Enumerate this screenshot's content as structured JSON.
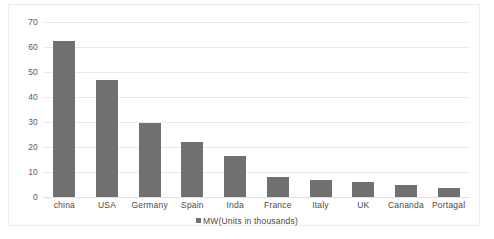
{
  "chart_data": {
    "type": "bar",
    "title": "",
    "subtitle": "",
    "xlabel": "",
    "ylabel": "",
    "ylim": [
      0,
      70
    ],
    "ytick_step": 10,
    "yticks": [
      70,
      60,
      50,
      40,
      30,
      20,
      10,
      0
    ],
    "grid": true,
    "legend_position": "bottom-center",
    "categories": [
      "china",
      "USA",
      "Germany",
      "Spain",
      "Inda",
      "France",
      "Italy",
      "UK",
      "Cananda",
      "Portagal"
    ],
    "series": [
      {
        "name": "MW(Units in thousands)",
        "color": "#707070",
        "values": [
          62.5,
          47,
          29.5,
          22,
          16.5,
          8,
          7,
          6,
          5,
          3.5
        ]
      }
    ]
  },
  "legend": {
    "marker": "square-marker",
    "label": "MW(Units in thousands)"
  },
  "colors": {
    "bar": "#707070",
    "gridline": "#eaeaea",
    "axis_text": "#4a4a4a",
    "frame": "#ececec",
    "background": "#ffffff"
  }
}
